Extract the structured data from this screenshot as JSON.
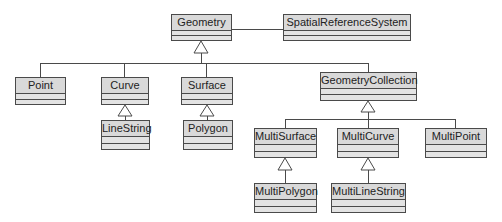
{
  "diagram": {
    "type": "UML class diagram",
    "classes": {
      "geometry": {
        "name": "Geometry"
      },
      "srs": {
        "name": "SpatialReferenceSystem"
      },
      "point": {
        "name": "Point"
      },
      "curve": {
        "name": "Curve"
      },
      "surface": {
        "name": "Surface"
      },
      "geometry_collection": {
        "name": "GeometryCollection"
      },
      "line_string": {
        "name": "LineString"
      },
      "polygon": {
        "name": "Polygon"
      },
      "multi_surface": {
        "name": "MultiSurface"
      },
      "multi_curve": {
        "name": "MultiCurve"
      },
      "multi_point": {
        "name": "MultiPoint"
      },
      "multi_polygon": {
        "name": "MultiPolygon"
      },
      "multi_line_string": {
        "name": "MultiLineString"
      }
    },
    "relationships": [
      {
        "type": "association",
        "from": "Geometry",
        "to": "SpatialReferenceSystem"
      },
      {
        "type": "generalization",
        "child": "Point",
        "parent": "Geometry"
      },
      {
        "type": "generalization",
        "child": "Curve",
        "parent": "Geometry"
      },
      {
        "type": "generalization",
        "child": "Surface",
        "parent": "Geometry"
      },
      {
        "type": "generalization",
        "child": "GeometryCollection",
        "parent": "Geometry"
      },
      {
        "type": "generalization",
        "child": "LineString",
        "parent": "Curve"
      },
      {
        "type": "generalization",
        "child": "Polygon",
        "parent": "Surface"
      },
      {
        "type": "generalization",
        "child": "MultiSurface",
        "parent": "GeometryCollection"
      },
      {
        "type": "generalization",
        "child": "MultiCurve",
        "parent": "GeometryCollection"
      },
      {
        "type": "generalization",
        "child": "MultiPoint",
        "parent": "GeometryCollection"
      },
      {
        "type": "generalization",
        "child": "MultiPolygon",
        "parent": "MultiSurface"
      },
      {
        "type": "generalization",
        "child": "MultiLineString",
        "parent": "MultiCurve"
      }
    ],
    "colors": {
      "box_fill": "#d9d9d9",
      "line": "#4a4a4a"
    }
  }
}
